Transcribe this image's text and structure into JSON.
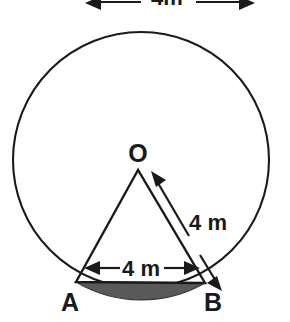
{
  "figure": {
    "canvas": {
      "width": 290,
      "height": 322,
      "background": "#ffffff"
    },
    "colors": {
      "stroke": "#1a1a1a",
      "segment_fill": "#595959",
      "circle_fill": "#ffffff"
    },
    "circle": {
      "center_x": 141,
      "center_y": 160,
      "radius": 128,
      "stroke_width": 2.1
    },
    "points": [
      {
        "id": "O",
        "label": "O",
        "x": 138,
        "y": 170,
        "label_x": 138,
        "label_y": 162
      },
      {
        "id": "A",
        "label": "A",
        "x": 76,
        "y": 282,
        "label_x": 70,
        "label_y": 311
      },
      {
        "id": "B",
        "label": "B",
        "x": 205,
        "y": 283,
        "label_x": 213,
        "label_y": 311
      }
    ],
    "dimensions": [
      {
        "id": "chord-ab",
        "label": "4 m",
        "label_x": 141,
        "label_y": 274,
        "arrow_from_x": 88,
        "arrow_from_y": 268,
        "arrow_to_x": 196,
        "arrow_to_y": 268,
        "double_headed": true
      },
      {
        "id": "radius-ob",
        "label": "4 m",
        "label_x": 208,
        "label_y": 222,
        "arrow_from_x": 152,
        "arrow_from_y": 175,
        "arrow_to_x": 216,
        "arrow_to_y": 281,
        "double_headed": true
      },
      {
        "id": "diameter-top",
        "label": "4m",
        "label_x": 167,
        "label_y": 6,
        "arrow_from_x": 86,
        "arrow_from_y": 4,
        "arrow_to_x": 254,
        "arrow_to_y": 4,
        "double_headed": true,
        "clipped_at_top": true
      }
    ],
    "shaded_segment": {
      "id": "segment-AB",
      "description": "circular segment between chord AB and minor arc AB",
      "fill": "#595959"
    }
  }
}
